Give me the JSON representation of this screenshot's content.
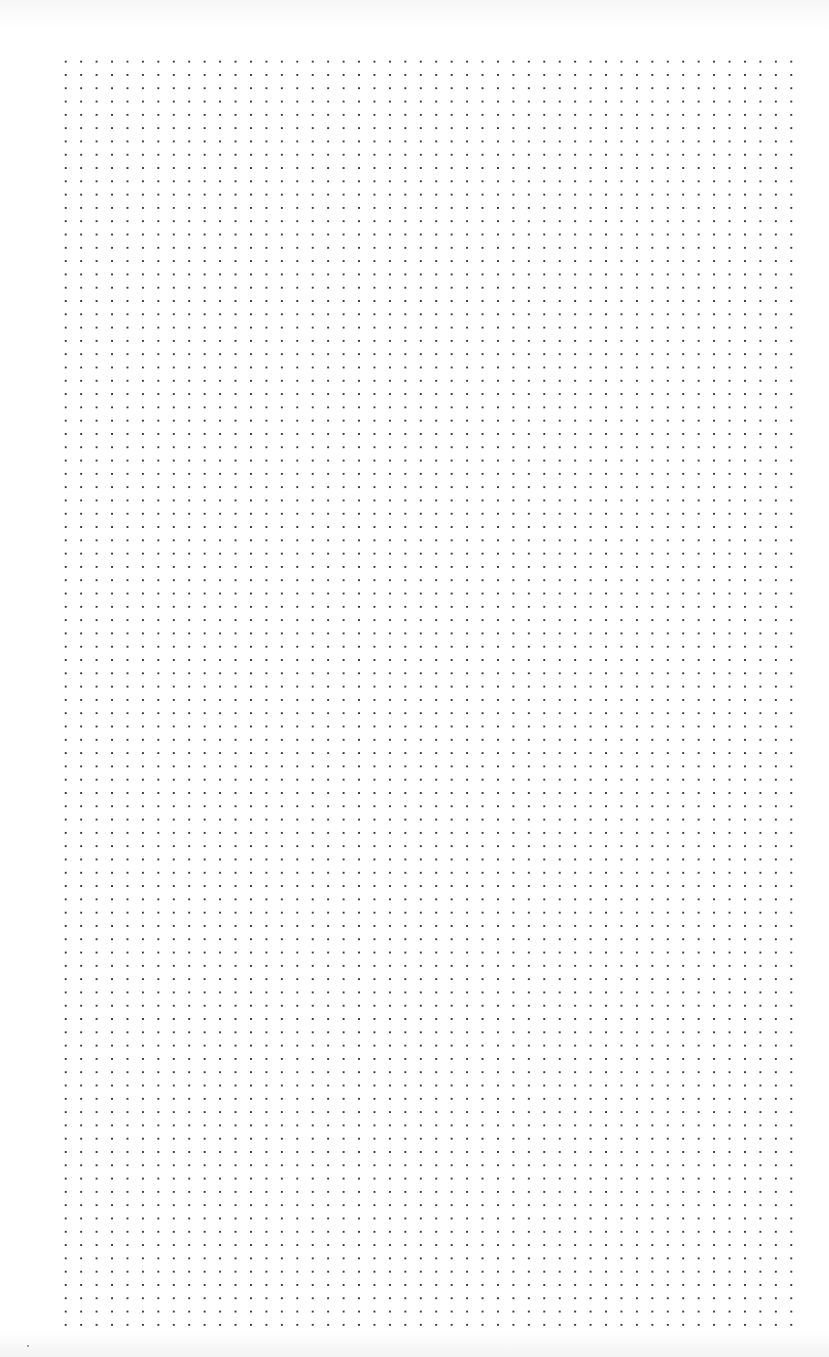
{
  "page": {
    "type": "dot-grid-paper",
    "background_color": "#ffffff",
    "dot_color": "#3a3a3a"
  },
  "grid": {
    "left": 58,
    "top": 55,
    "width": 741,
    "height": 1271,
    "spacing_x": 15.45,
    "spacing_y": 13.3,
    "columns": 48,
    "rows": 96
  }
}
